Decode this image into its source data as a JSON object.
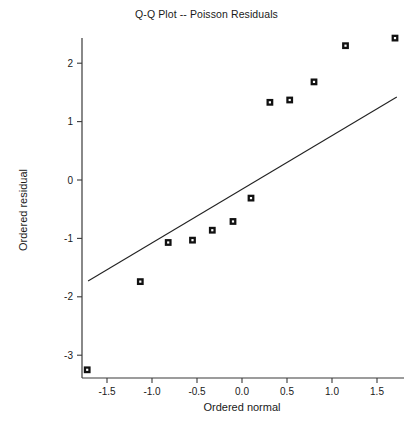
{
  "chart_data": {
    "type": "scatter",
    "title": "Q-Q Plot -- Poisson Residuals",
    "xlabel": "Ordered normal",
    "ylabel": "Ordered residual",
    "xlim": [
      -1.95,
      1.92
    ],
    "ylim": [
      -3.45,
      2.62
    ],
    "grid": false,
    "legend": null,
    "x_ticks": [
      -1.5,
      -1.0,
      -0.5,
      0.0,
      0.5,
      1.0,
      1.5
    ],
    "x_tick_labels": [
      "-1.5",
      "-1.0",
      "-0.5",
      "0.0",
      "0.5",
      "1.0",
      "1.5"
    ],
    "y_ticks": [
      2,
      1,
      0,
      -1,
      -2,
      -3
    ],
    "y_tick_labels": [
      "2",
      "1",
      "0",
      "-1",
      "-2",
      "-3"
    ],
    "marker": "filled-square-with-x",
    "marker_color": "#111111",
    "points": [
      {
        "x": -1.72,
        "y": -3.25
      },
      {
        "x": -1.13,
        "y": -1.74
      },
      {
        "x": -0.82,
        "y": -1.07
      },
      {
        "x": -0.55,
        "y": -1.03
      },
      {
        "x": -0.33,
        "y": -0.86
      },
      {
        "x": -0.1,
        "y": -0.71
      },
      {
        "x": 0.1,
        "y": -0.31
      },
      {
        "x": 0.31,
        "y": 1.33
      },
      {
        "x": 0.53,
        "y": 1.37
      },
      {
        "x": 0.8,
        "y": 1.68
      },
      {
        "x": 1.15,
        "y": 2.3
      },
      {
        "x": 1.7,
        "y": 2.43
      }
    ],
    "reference_line": {
      "name": "qq-reference-line",
      "x1": -1.71,
      "y1": -1.73,
      "x2": 1.72,
      "y2": 1.42,
      "color": "#222222"
    }
  }
}
